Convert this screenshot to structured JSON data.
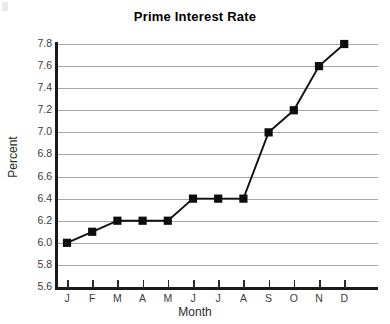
{
  "chart_data": {
    "type": "line",
    "title": "Prime Interest Rate",
    "xlabel": "Month",
    "ylabel": "Percent",
    "categories": [
      "J",
      "F",
      "M",
      "A",
      "M",
      "J",
      "J",
      "A",
      "S",
      "O",
      "N",
      "D"
    ],
    "values": [
      6.0,
      6.1,
      6.2,
      6.2,
      6.2,
      6.4,
      6.4,
      6.4,
      7.0,
      7.2,
      7.6,
      7.8
    ],
    "ylim": [
      5.6,
      7.8
    ],
    "yticks": [
      7.8,
      7.6,
      7.4,
      7.2,
      7.0,
      6.8,
      6.6,
      6.4,
      6.2,
      6.0,
      5.8,
      5.6
    ],
    "ytick_labels": [
      "7.8",
      "7.6",
      "7.4",
      "7.2",
      "7.0",
      "6.8",
      "6.6",
      "6.4",
      "6.2",
      "6.0",
      "5.8",
      "5.6"
    ],
    "grid": true,
    "legend": false,
    "marker": "filled-square",
    "series_color": "#111111",
    "grid_color": "#a7a7a7",
    "axis_color": "#1a1a1a"
  }
}
